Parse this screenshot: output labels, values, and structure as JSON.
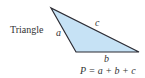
{
  "diagram": {
    "title": "Triangle",
    "shape": "triangle",
    "fill_color": "#c6e2f5",
    "stroke_color": "#2b2b33",
    "vertices": [
      [
        51,
        8
      ],
      [
        76,
        52
      ],
      [
        139,
        52
      ]
    ],
    "side_labels": {
      "a": "a",
      "b": "b",
      "c": "c"
    },
    "formula": "P = a + b + c"
  }
}
